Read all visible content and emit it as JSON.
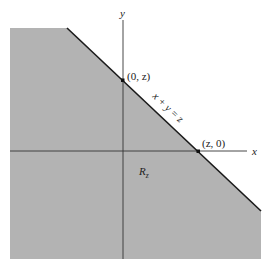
{
  "diagram": {
    "axes": {
      "x_label": "x",
      "y_label": "y"
    },
    "line": {
      "equation_label": "x + y = z"
    },
    "points": [
      {
        "label": "(0, z)"
      },
      {
        "label": "(z, 0)"
      }
    ],
    "region": {
      "label_main": "R",
      "label_sub": "z",
      "fill_color": "#b3b3b3"
    },
    "colors": {
      "axis": "#333333",
      "line": "#1a1a1a",
      "point": "#111111"
    }
  }
}
